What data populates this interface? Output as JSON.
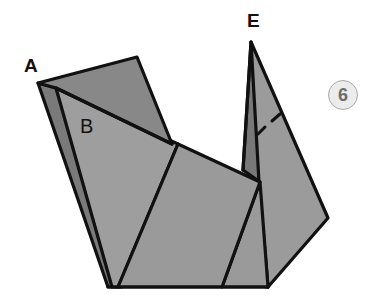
{
  "figure": {
    "step_number": "6",
    "labels": {
      "a": "A",
      "b": "B",
      "e": "E"
    },
    "colors": {
      "paper_light": "#9d9d9d",
      "paper_mid": "#8f8f8f",
      "paper_dark": "#7a7a7a",
      "outline": "#111111",
      "badge_fill": "#ececec",
      "badge_text": "#6d6d6d"
    }
  }
}
